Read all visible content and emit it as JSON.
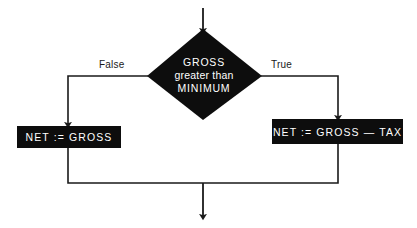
{
  "diagram": {
    "type": "flowchart",
    "title": "",
    "colors": {
      "node_fill": "#0d0d0d",
      "node_text": "#ffffff",
      "line": "#1a1a1a",
      "background": "#ffffff",
      "label_text": "#1a1a1a"
    },
    "entry": {
      "name": "entry-arrow",
      "label": ""
    },
    "decision": {
      "shape": "diamond",
      "line_1": "GROSS",
      "line_2": "greater than",
      "line_3": "MINIMUM"
    },
    "branches": [
      {
        "id": "false",
        "label": "False",
        "target": "process-left"
      },
      {
        "id": "true",
        "label": "True",
        "target": "process-right"
      }
    ],
    "processes": [
      {
        "id": "process-left",
        "shape": "rectangle",
        "text": "NET := GROSS"
      },
      {
        "id": "process-right",
        "shape": "rectangle",
        "text": "NET := GROSS — TAX"
      }
    ],
    "merge": {
      "name": "merge-junction",
      "exit_label": ""
    }
  }
}
